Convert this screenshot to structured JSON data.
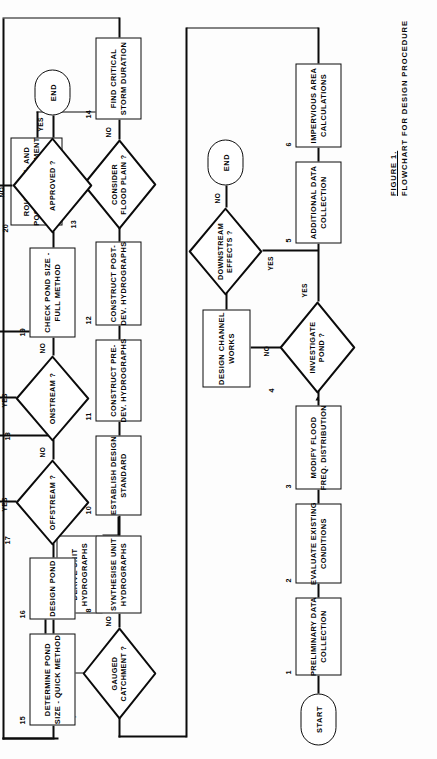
{
  "figure": {
    "label": "FIGURE 1.",
    "title": "FLOWCHART FOR DESIGN PROCEDURE"
  },
  "terminators": {
    "start": "START",
    "end_downstream": "END",
    "end_approved": "END"
  },
  "steps": [
    {
      "num": "1",
      "shape": "process",
      "lines": [
        "PRELIMINARY  DATA",
        "COLLECTION"
      ]
    },
    {
      "num": "2",
      "shape": "process",
      "lines": [
        "EVALUATE  EXISTING",
        "CONDITIONS"
      ]
    },
    {
      "num": "3",
      "shape": "process",
      "lines": [
        "MODIFY  FLOOD",
        "FREQ. DISTRIBUTION"
      ]
    },
    {
      "num": "4",
      "shape": "decision",
      "lines": [
        "INVESTIGATE",
        "POND ?"
      ]
    },
    {
      "num": "5",
      "shape": "process",
      "lines": [
        "ADDITIONAL  DATA",
        "COLLECTION"
      ]
    },
    {
      "num": "6",
      "shape": "process",
      "lines": [
        "IMPERVIOUS  AREA",
        "CALCULATIONS"
      ]
    },
    {
      "num": "7",
      "shape": "decision",
      "lines": [
        "GAUGED",
        "CATCHMENT ?"
      ]
    },
    {
      "num": "8",
      "shape": "process",
      "lines": [
        "SYNTHESISE  UNIT",
        "HYDROGRAPHS"
      ]
    },
    {
      "num": "9",
      "shape": "process",
      "lines": [
        "DERIVE  UNIT",
        "HYDROGRAPHS"
      ]
    },
    {
      "num": "10",
      "shape": "process",
      "lines": [
        "ESTABLISH  DESIGN",
        "STANDARD"
      ]
    },
    {
      "num": "11",
      "shape": "process",
      "lines": [
        "CONSTRUCT  PRE-",
        "DEV. HYDROGRAPHS"
      ]
    },
    {
      "num": "12",
      "shape": "process",
      "lines": [
        "CONSTRUCT  POST-",
        "DEV. HYDROGRAPHS"
      ]
    },
    {
      "num": "13",
      "shape": "decision",
      "lines": [
        "CONSIDER",
        "FLOOD  PLAIN ?"
      ]
    },
    {
      "num": "14",
      "shape": "process",
      "lines": [
        "FIND  CRITICAL",
        "STORM  DURATION"
      ]
    },
    {
      "num": "15",
      "shape": "process",
      "lines": [
        "DETERMINE  POND",
        "SIZE - QUICK  METHOD"
      ]
    },
    {
      "num": "16",
      "shape": "process",
      "lines": [
        "DESIGN  POND"
      ]
    },
    {
      "num": "17",
      "shape": "decision",
      "lines": [
        "OFFSTREAM ?"
      ]
    },
    {
      "num": "18",
      "shape": "decision",
      "lines": [
        "ONSTREAM ?"
      ]
    },
    {
      "num": "19",
      "shape": "process",
      "lines": [
        "CHECK  POND  SIZE -",
        "FULL  METHOD"
      ]
    },
    {
      "num": "20",
      "shape": "decision",
      "lines": [
        "APPROVED ?"
      ]
    }
  ],
  "unnumbered": [
    {
      "key": "design_channel_works",
      "lines": [
        "DESIGN  CHANNEL",
        "WORKS"
      ]
    },
    {
      "key": "downstream_effects",
      "lines": [
        "DOWNSTREAM",
        "EFFECTS ?"
      ]
    },
    {
      "key": "route_hydrographs",
      "lines": [
        "ROUTE  PRE- AND",
        "POST -DEVELOPMENT",
        "HYDROGRAPHS"
      ]
    },
    {
      "key": "consider_short",
      "lines": [
        "CONSIDER  SHORT",
        "DURATION  STORMS"
      ]
    },
    {
      "key": "consider_long",
      "lines": [
        "CONSIDER  LONG",
        "DURATION  STORMS"
      ]
    },
    {
      "key": "revise_design",
      "lines": [
        "REVISE  DESIGN"
      ]
    }
  ],
  "branch_labels": {
    "investigate_no": "NO",
    "investigate_yes": "YES",
    "downstream_no": "NO",
    "downstream_yes": "YES",
    "gauged_yes": "YES",
    "gauged_no": "NO",
    "floodplain_yes": "YES",
    "floodplain_no": "NO",
    "offstream_yes": "YES",
    "offstream_no": "NO",
    "onstream_yes": "YES",
    "onstream_no": "NO",
    "approved_no": "NO",
    "approved_yes": "YES"
  },
  "colors": {
    "ink": "#0b0b0b",
    "paper": "#fdfdfd"
  }
}
